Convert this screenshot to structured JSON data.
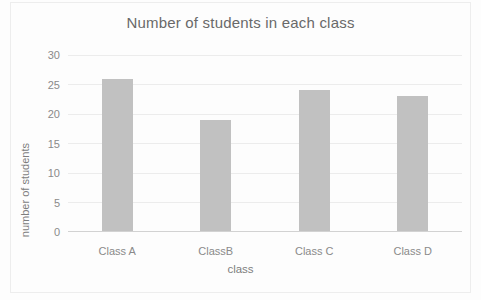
{
  "chart_data": {
    "type": "bar",
    "title": "Number of students in each class",
    "categories": [
      "Class A",
      "ClassB",
      "Class C",
      "Class D"
    ],
    "values": [
      26,
      19,
      24,
      23
    ],
    "xlabel": "class",
    "ylabel": "number of students",
    "ylim": [
      0,
      30
    ],
    "yticks": [
      0,
      5,
      10,
      15,
      20,
      25,
      30
    ],
    "grid": true,
    "legend": "none",
    "colors": {
      "bar_fill": "#c1c1c1",
      "gridline": "#ececec",
      "axis_line": "#d2d2d2",
      "tick_text": "#8a8a8a",
      "axis_title_text": "#7d7d7d",
      "title_text": "#696969",
      "background": "#fdfdfd",
      "frame_border": "#ededed"
    }
  }
}
